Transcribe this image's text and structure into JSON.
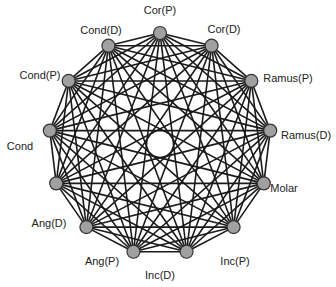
{
  "diagram": {
    "type": "complete-graph",
    "center": [
      160,
      144
    ],
    "radius": 111,
    "node_color": "#a0a0a0",
    "edge_color": "#1a1a1a",
    "nodes": [
      {
        "label": "Cor(P)",
        "lx": 160,
        "ly": 10
      },
      {
        "label": "Cor(D)",
        "lx": 224,
        "ly": 29
      },
      {
        "label": "Ramus(P)",
        "lx": 288,
        "ly": 78
      },
      {
        "label": "Ramus(D)",
        "lx": 306,
        "ly": 135
      },
      {
        "label": "Molar",
        "lx": 284,
        "ly": 188
      },
      {
        "label": "Inc(P)",
        "lx": 235,
        "ly": 261
      },
      {
        "label": "Inc(D)",
        "lx": 160,
        "ly": 275
      },
      {
        "label": "Ang(P)",
        "lx": 102,
        "ly": 261
      },
      {
        "label": "Ang(D)",
        "lx": 49,
        "ly": 223
      },
      {
        "label": "Cond",
        "lx": 20,
        "ly": 146
      },
      {
        "label": "Cond(P)",
        "lx": 40,
        "ly": 75
      },
      {
        "label": "Cond(D)",
        "lx": 101,
        "ly": 30
      },
      {
        "label": "Cor(P)2",
        "lx": 0,
        "ly": 0
      }
    ]
  }
}
